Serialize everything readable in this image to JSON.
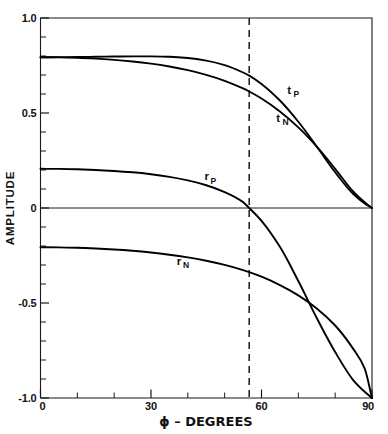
{
  "chart_data": {
    "type": "line",
    "title": "",
    "xlabel": "ϕ – DEGREES",
    "ylabel": "AMPLITUDE",
    "xlim": [
      0,
      90
    ],
    "ylim": [
      -1.0,
      1.0
    ],
    "grid": false,
    "legend_position": "inline-curve-labels",
    "x_ticks_major": [
      0,
      30,
      60,
      90
    ],
    "x_tick_labels": [
      "0",
      "30",
      "60",
      "90"
    ],
    "x_ticks_minor": [
      10,
      20,
      40,
      50,
      70,
      80
    ],
    "y_ticks_major": [
      1.0,
      0.5,
      0,
      -0.5,
      -1.0
    ],
    "y_tick_labels": [
      "1.0",
      "0.5",
      "0",
      "-0.5",
      "-1.0"
    ],
    "y_ticks_minor": [
      0.9,
      0.8,
      0.7,
      0.6,
      0.4,
      0.3,
      0.2,
      0.1,
      -0.1,
      -0.2,
      -0.3,
      -0.4,
      -0.6,
      -0.7,
      -0.8,
      -0.9
    ],
    "refractive_index": 1.52,
    "brewster_angle_deg": 56.66,
    "annotations": [
      {
        "label": "t",
        "subscript": "P",
        "x": 67.0,
        "y": 0.6
      },
      {
        "label": "t",
        "subscript": "N",
        "x": 64.0,
        "y": 0.455
      },
      {
        "label": "r",
        "subscript": "P",
        "x": 44.5,
        "y": 0.145
      },
      {
        "label": "r",
        "subscript": "N",
        "x": 37.0,
        "y": -0.3
      }
    ],
    "x": [
      0,
      5,
      10,
      15,
      20,
      25,
      30,
      35,
      40,
      45,
      50,
      55,
      56.66,
      60,
      65,
      70,
      75,
      80,
      85,
      88,
      90
    ],
    "series": [
      {
        "name": "t_P",
        "label": "tP",
        "values": [
          0.7937,
          0.7939,
          0.7947,
          0.7958,
          0.7971,
          0.7982,
          0.7982,
          0.7958,
          0.7892,
          0.7758,
          0.752,
          0.7132,
          0.6968,
          0.6531,
          0.5656,
          0.4539,
          0.3235,
          0.188,
          0.072,
          0.0243,
          0.0
        ]
      },
      {
        "name": "t_N",
        "label": "tN",
        "values": [
          0.7937,
          0.7929,
          0.7904,
          0.7861,
          0.7798,
          0.7711,
          0.7596,
          0.7447,
          0.7255,
          0.701,
          0.6696,
          0.6292,
          0.6131,
          0.5766,
          0.5081,
          0.4242,
          0.3231,
          0.2064,
          0.0843,
          0.0302,
          0.0
        ]
      },
      {
        "name": "r_P",
        "label": "rP",
        "values": [
          0.2063,
          0.2057,
          0.2037,
          0.2003,
          0.1951,
          0.1878,
          0.1778,
          0.1641,
          0.1454,
          0.1198,
          0.084,
          0.031,
          0.0,
          -0.0675,
          -0.2046,
          -0.3844,
          -0.5791,
          -0.758,
          -0.9081,
          -0.9668,
          -1.0
        ]
      },
      {
        "name": "r_N",
        "label": "rN",
        "values": [
          -0.2063,
          -0.207,
          -0.2092,
          -0.2129,
          -0.2182,
          -0.2253,
          -0.2344,
          -0.2459,
          -0.2601,
          -0.2777,
          -0.2996,
          -0.3269,
          -0.3374,
          -0.3614,
          -0.4054,
          -0.4597,
          -0.5284,
          -0.6185,
          -0.7442,
          -0.8438,
          -1.0
        ]
      }
    ]
  }
}
